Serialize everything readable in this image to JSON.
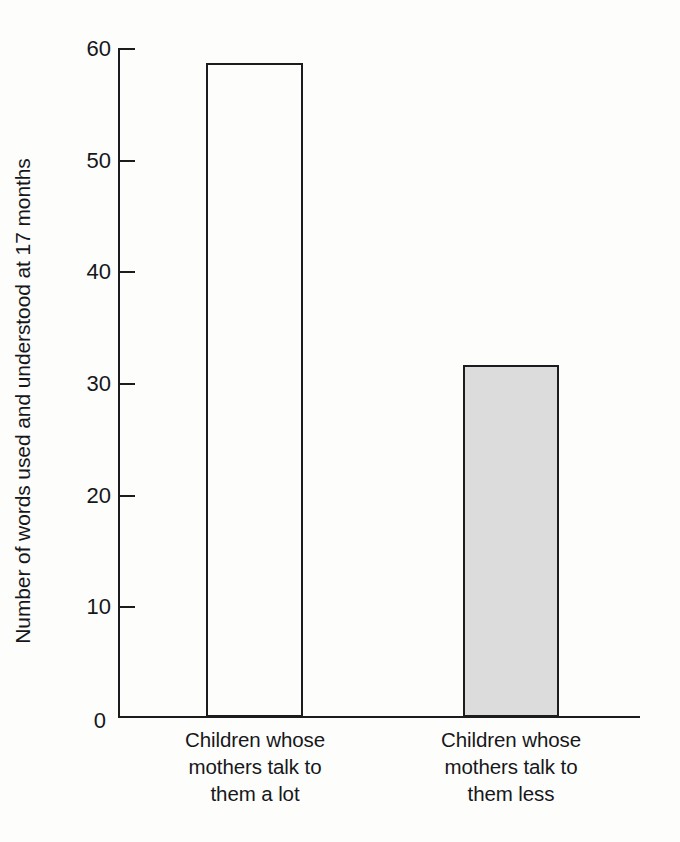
{
  "chart_data": {
    "type": "bar",
    "title": "",
    "subtitle": "",
    "xlabel": "",
    "ylabel": "Number of words used and understood at 17 months",
    "categories": [
      "Children whose mothers talk to them a lot",
      "Children whose mothers talk to them less"
    ],
    "values": [
      58.6,
      31.5
    ],
    "ylim": [
      0,
      60
    ],
    "y_ticks": [
      0,
      10,
      20,
      30,
      40,
      50,
      60
    ],
    "y_tick_labels": [
      "0",
      "10",
      "20",
      "30",
      "40",
      "50",
      "60"
    ],
    "grid": false,
    "legend": false,
    "legend_position": "none",
    "bar_styles": [
      {
        "fill": "#fdfdfc",
        "stroke": "#1c1c1e",
        "name": "open-white"
      },
      {
        "fill": "#dcdcdc",
        "stroke": "#1c1c1e",
        "name": "shaded-grey"
      }
    ]
  },
  "axis": {
    "y_title": "Number of words used and understood at 17 months",
    "ticks": [
      {
        "value": 60,
        "label": "60"
      },
      {
        "value": 50,
        "label": "50"
      },
      {
        "value": 40,
        "label": "40"
      },
      {
        "value": 30,
        "label": "30"
      },
      {
        "value": 20,
        "label": "20"
      },
      {
        "value": 10,
        "label": "10"
      },
      {
        "value": 0,
        "label": "0"
      }
    ]
  },
  "categories": [
    {
      "id": "talk-a-lot",
      "lines": [
        "Children whose",
        "mothers talk to",
        "them a lot"
      ],
      "value": 58.6
    },
    {
      "id": "talk-less",
      "lines": [
        "Children whose",
        "mothers talk to",
        "them less"
      ],
      "value": 31.5
    }
  ],
  "colors": {
    "ink": "#1c1c1e",
    "text": "#17171a",
    "bar_open_fill": "#fdfdfc",
    "bar_shaded_fill": "#dcdcdc",
    "background": "#fdfdfc"
  }
}
